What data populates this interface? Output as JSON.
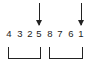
{
  "diagram": {
    "digits": [
      "4",
      "3",
      "2",
      "5",
      "8",
      "7",
      "6",
      "1"
    ],
    "arrows": [
      {
        "points_to_index": 3,
        "label": "arrow-down-icon"
      },
      {
        "points_to_index": 7,
        "label": "arrow-down-icon"
      }
    ],
    "brackets": [
      {
        "from_index": 0,
        "to_index": 3
      },
      {
        "from_index": 4,
        "to_index": 7
      }
    ],
    "colors": {
      "ink": "#222222",
      "background": "#ffffff"
    }
  }
}
